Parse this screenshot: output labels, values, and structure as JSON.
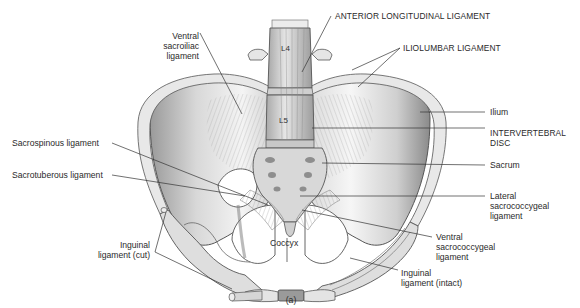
{
  "figure": {
    "panel_label": "(a)"
  },
  "vertebrae": {
    "l4": "L4",
    "l5": "L5"
  },
  "labels": {
    "anterior_longitudinal": "ANTERIOR LONGITUDINAL LIGAMENT",
    "iliolumbar": "ILIOLUMBAR LIGAMENT",
    "ventral_sacroiliac": [
      "Ventral",
      "sacroiliac",
      "ligament"
    ],
    "ilium": "Ilium",
    "intervertebral_disc": [
      "INTERVERTEBRAL",
      "DISC"
    ],
    "sacrospinous": "Sacrospinous ligament",
    "sacrum": "Sacrum",
    "sacrotuberous": "Sacrotuberous ligament",
    "lateral_sacrococcygeal": [
      "Lateral",
      "sacrococcygeal",
      "ligament"
    ],
    "coccyx": "Coccyx",
    "ventral_sacrococcygeal": [
      "Ventral",
      "sacrococcygeal",
      "ligament"
    ],
    "inguinal_cut": [
      "Inguinal",
      "ligament (cut)"
    ],
    "inguinal_intact": [
      "Inguinal",
      "ligament (intact)"
    ]
  }
}
